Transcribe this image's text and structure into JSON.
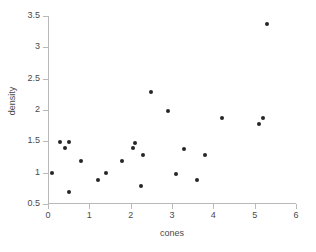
{
  "chart_data": {
    "type": "scatter",
    "title": "",
    "xlabel": "cones",
    "ylabel": "density",
    "xlim": [
      0,
      6
    ],
    "ylim": [
      0.5,
      3.5
    ],
    "xticks": [
      0,
      1,
      2,
      3,
      4,
      5,
      6
    ],
    "xticklabels": [
      "0",
      "1",
      "2",
      "3",
      "4",
      "5",
      "6"
    ],
    "yticks": [
      0.5,
      1,
      1.5,
      2,
      2.5,
      3,
      3.5
    ],
    "yticklabels": [
      "0.5",
      "1",
      "1.5",
      "2",
      "2.5",
      "3",
      "3.5"
    ],
    "grid": false,
    "legend": null,
    "marker": {
      "shape": "circle",
      "color": "#262626",
      "size": 4
    },
    "axis_color": "#b9b9b9",
    "background": "#ffffff",
    "points": [
      {
        "x": 0.1,
        "y": 1.0
      },
      {
        "x": 0.3,
        "y": 1.49
      },
      {
        "x": 0.4,
        "y": 1.4
      },
      {
        "x": 0.5,
        "y": 1.49
      },
      {
        "x": 0.5,
        "y": 0.69
      },
      {
        "x": 0.8,
        "y": 1.19
      },
      {
        "x": 1.2,
        "y": 0.89
      },
      {
        "x": 1.4,
        "y": 1.0
      },
      {
        "x": 1.8,
        "y": 1.19
      },
      {
        "x": 2.05,
        "y": 1.39
      },
      {
        "x": 2.1,
        "y": 1.48
      },
      {
        "x": 2.25,
        "y": 0.79
      },
      {
        "x": 2.3,
        "y": 1.28
      },
      {
        "x": 2.5,
        "y": 2.28
      },
      {
        "x": 2.9,
        "y": 1.98
      },
      {
        "x": 3.1,
        "y": 0.98
      },
      {
        "x": 3.3,
        "y": 1.38
      },
      {
        "x": 3.6,
        "y": 0.88
      },
      {
        "x": 3.8,
        "y": 1.28
      },
      {
        "x": 4.2,
        "y": 1.88
      },
      {
        "x": 5.1,
        "y": 1.77
      },
      {
        "x": 5.2,
        "y": 1.88
      },
      {
        "x": 5.3,
        "y": 3.37
      }
    ]
  }
}
